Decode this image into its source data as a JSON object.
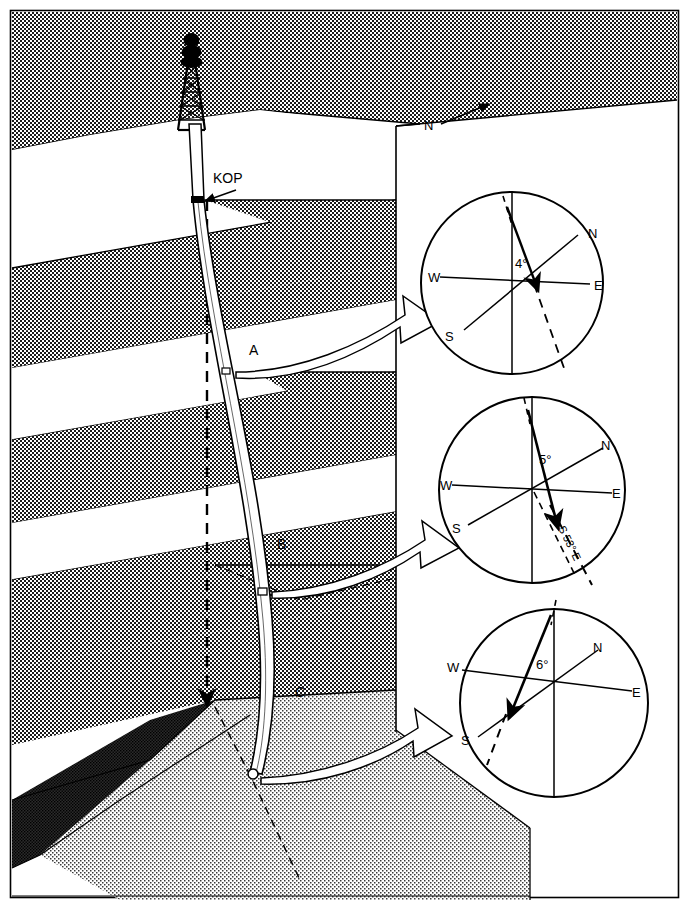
{
  "figure": {
    "type": "directional-drilling-block-diagram",
    "frame": {
      "border_color": "#000000",
      "background": "#ffffff"
    },
    "north_arrow": {
      "label": "N",
      "direction": "up-right"
    },
    "surface": {
      "derrick_name": "drilling-derrick",
      "kop": {
        "label": "KOP",
        "description": "kick-off point"
      }
    },
    "wellpath": {
      "vertical_label": "vertical-reference-line",
      "survey_stations": [
        {
          "label": "A"
        },
        {
          "label": "B"
        },
        {
          "label": "C"
        }
      ]
    },
    "layers": [
      {
        "name": "overburden-top",
        "fill": "stipple-medium"
      },
      {
        "name": "shale-band-1",
        "fill": "white"
      },
      {
        "name": "sand-band-1",
        "fill": "stipple-medium"
      },
      {
        "name": "shale-band-2",
        "fill": "white"
      },
      {
        "name": "sand-band-2",
        "fill": "stipple-medium"
      },
      {
        "name": "shale-band-3",
        "fill": "white"
      },
      {
        "name": "sand-band-3",
        "fill": "stipple-medium"
      },
      {
        "name": "marker-bed-dark",
        "fill": "stipple-dark"
      },
      {
        "name": "target-reservoir",
        "fill": "stipple-light"
      }
    ],
    "callouts": [
      {
        "name": "callout-arrow-a",
        "from": "A",
        "to": "compass-a"
      },
      {
        "name": "callout-arrow-b",
        "from": "B",
        "to": "compass-b"
      },
      {
        "name": "callout-arrow-c",
        "from": "C",
        "to": "compass-c"
      }
    ]
  },
  "compasses": [
    {
      "id": "compass-a",
      "station": "A",
      "angle_label": "4°",
      "cardinals": {
        "n": "N",
        "e": "E",
        "s": "S",
        "w": "W"
      },
      "bearing_label": ""
    },
    {
      "id": "compass-b",
      "station": "B",
      "angle_label": "5°",
      "cardinals": {
        "n": "N",
        "e": "E",
        "s": "S",
        "w": "W"
      },
      "bearing_label": "S 53° E"
    },
    {
      "id": "compass-c",
      "station": "C",
      "angle_label": "6°",
      "cardinals": {
        "n": "N",
        "e": "E",
        "s": "S",
        "w": "W"
      },
      "bearing_label": ""
    }
  ]
}
